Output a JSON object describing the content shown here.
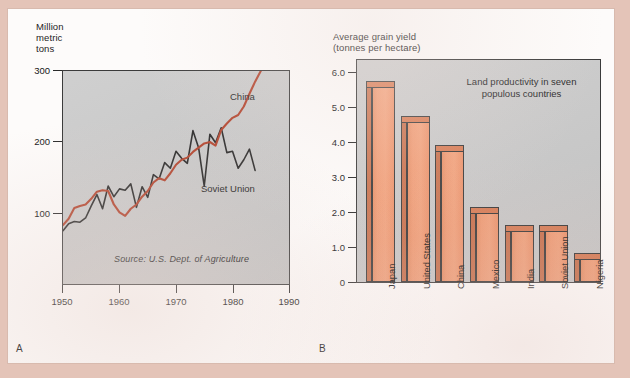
{
  "figure": {
    "panel_a_letter": "A",
    "panel_b_letter": "B"
  },
  "panel_a": {
    "axis_title": "Million\nmetric\ntons",
    "source_note": "Source: U.S. Dept. of Agriculture",
    "y_ticks": [
      "300",
      "200",
      "100"
    ],
    "x_ticks": [
      "1950",
      "1960",
      "1970",
      "1980",
      "1990"
    ],
    "series_labels": {
      "china": "China",
      "soviet": "Soviet Union"
    },
    "colors": {
      "china": "#b03a22",
      "soviet": "#1d1d1d",
      "plot_bg": "#c9c9c9"
    }
  },
  "panel_b": {
    "axis_title": "Average grain yield\n(tonnes per hectare)",
    "note": "Land productivity in seven\npopulous countries",
    "y_ticks": [
      "6.0",
      "5.0",
      "4.0",
      "3.0",
      "2.0",
      "1.0",
      "0"
    ],
    "colors": {
      "bar_face": "#f0956c",
      "bar_shade": "#cd6f48",
      "plot_bg": "#c9c9c9"
    }
  },
  "chart_data": [
    {
      "id": "panel-a",
      "type": "line",
      "title": "",
      "xlabel": "",
      "ylabel": "Million metric tons",
      "xlim": [
        1950,
        1990
      ],
      "ylim": [
        0,
        300
      ],
      "yticks": [
        100,
        200,
        300
      ],
      "xticks": [
        1950,
        1960,
        1970,
        1980,
        1990
      ],
      "grid": false,
      "legend": "inline annotations",
      "annotations": [
        "China",
        "Soviet Union",
        "Source: U.S. Dept. of Agriculture"
      ],
      "x": [
        1950,
        1951,
        1952,
        1953,
        1954,
        1955,
        1956,
        1957,
        1958,
        1959,
        1960,
        1961,
        1962,
        1963,
        1964,
        1965,
        1966,
        1967,
        1968,
        1969,
        1970,
        1971,
        1972,
        1973,
        1974,
        1975,
        1976,
        1977,
        1978,
        1979,
        1980,
        1981,
        1982,
        1983,
        1984,
        1985
      ],
      "series": [
        {
          "name": "China",
          "color": "#b03a22",
          "values": [
            83,
            92,
            107,
            110,
            112,
            120,
            130,
            132,
            131,
            112,
            101,
            96,
            106,
            112,
            123,
            131,
            143,
            149,
            146,
            156,
            168,
            175,
            178,
            186,
            192,
            198,
            200,
            195,
            217,
            226,
            234,
            238,
            250,
            268,
            285,
            300
          ]
        },
        {
          "name": "Soviet Union",
          "color": "#1d1d1d",
          "values": [
            75,
            85,
            88,
            87,
            93,
            110,
            126,
            106,
            138,
            123,
            134,
            132,
            141,
            108,
            137,
            122,
            154,
            148,
            171,
            163,
            187,
            177,
            170,
            216,
            192,
            138,
            211,
            199,
            220,
            185,
            187,
            163,
            175,
            190,
            160
          ]
        }
      ]
    },
    {
      "id": "panel-b",
      "type": "bar",
      "title": "Land productivity in seven populous countries",
      "xlabel": "",
      "ylabel": "Average grain yield (tonnes per hectare)",
      "ylim": [
        0,
        6.4
      ],
      "yticks": [
        0,
        1.0,
        2.0,
        3.0,
        4.0,
        5.0,
        6.0
      ],
      "grid": false,
      "categories": [
        "Japan",
        "United States",
        "China",
        "Mexico",
        "India",
        "Soviet Union",
        "Nigeria"
      ],
      "values": [
        5.8,
        4.8,
        3.95,
        2.15,
        1.65,
        1.65,
        0.85
      ]
    }
  ]
}
